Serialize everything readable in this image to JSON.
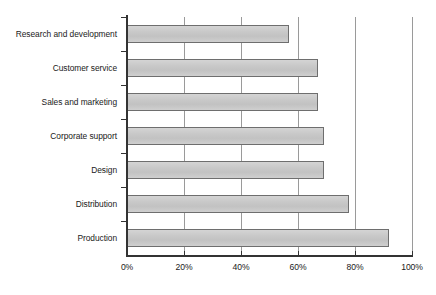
{
  "chart_data": {
    "type": "bar",
    "orientation": "horizontal",
    "title": "",
    "subtitle": "",
    "xlabel": "",
    "ylabel": "",
    "grid": true,
    "legend": false,
    "legend_position": "none",
    "xlim": [
      0,
      100
    ],
    "xtick_labels": [
      "0%",
      "20%",
      "40%",
      "60%",
      "80%",
      "100%"
    ],
    "xticks": [
      0,
      20,
      40,
      60,
      80,
      100
    ],
    "categories": [
      "Research and development",
      "Customer service",
      "Sales and marketing",
      "Corporate support",
      "Design",
      "Distribution",
      "Production"
    ],
    "values": [
      57,
      67,
      67,
      69,
      69,
      78,
      92
    ],
    "value_unit": "%",
    "series": [
      {
        "name": "",
        "values": [
          57,
          67,
          67,
          69,
          69,
          78,
          92
        ]
      }
    ],
    "colors": {
      "bar_fill": "#c9c9c9",
      "bar_border": "#6e6e6e",
      "gridline": "#9a9a9a",
      "axis": "#333333",
      "text": "#1a1a1a",
      "background": "#ffffff"
    }
  }
}
